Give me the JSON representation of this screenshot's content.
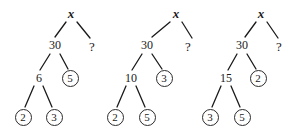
{
  "figure": {
    "background_color": "#ffffff",
    "ink_color": "#1a1a1a",
    "circle_stroke_color": "#2b2b2b",
    "root_label": "x",
    "unknown_label": "?"
  },
  "trees": [
    {
      "id": "tree-1",
      "root": {
        "label": "x",
        "kind": "variable",
        "x": 71,
        "y": 13
      },
      "nodes": [
        {
          "name": "root-x",
          "label": "x",
          "kind": "variable",
          "x": 71,
          "y": 13
        },
        {
          "name": "node-30",
          "label": "30",
          "kind": "plain",
          "x": 55,
          "y": 45
        },
        {
          "name": "node-unknown",
          "label": "?",
          "kind": "unknown",
          "x": 92,
          "y": 46
        },
        {
          "name": "node-6",
          "label": "6",
          "kind": "plain",
          "x": 39,
          "y": 78
        },
        {
          "name": "node-5",
          "label": "5",
          "kind": "circled",
          "x": 70,
          "y": 78
        },
        {
          "name": "node-2",
          "label": "2",
          "kind": "circled",
          "x": 23,
          "y": 117
        },
        {
          "name": "node-3",
          "label": "3",
          "kind": "circled",
          "x": 54,
          "y": 117
        }
      ],
      "edges": [
        {
          "from": "root-x",
          "to": "node-30",
          "x1": 66,
          "y1": 22,
          "x2": 55,
          "y2": 37
        },
        {
          "from": "root-x",
          "to": "node-unknown",
          "x1": 77,
          "y1": 22,
          "x2": 90,
          "y2": 38
        },
        {
          "from": "node-30",
          "to": "node-6",
          "x1": 50,
          "y1": 54,
          "x2": 40,
          "y2": 70
        },
        {
          "from": "node-30",
          "to": "node-5",
          "x1": 60,
          "y1": 54,
          "x2": 68,
          "y2": 69
        },
        {
          "from": "node-6",
          "to": "node-2",
          "x1": 34,
          "y1": 86,
          "x2": 25,
          "y2": 107
        },
        {
          "from": "node-6",
          "to": "node-3",
          "x1": 43,
          "y1": 86,
          "x2": 52,
          "y2": 107
        }
      ]
    },
    {
      "id": "tree-2",
      "root": {
        "label": "x",
        "kind": "variable",
        "x": 76,
        "y": 13
      },
      "nodes": [
        {
          "name": "root-x",
          "label": "x",
          "kind": "variable",
          "x": 76,
          "y": 13
        },
        {
          "name": "node-30",
          "label": "30",
          "kind": "plain",
          "x": 47,
          "y": 45
        },
        {
          "name": "node-unknown",
          "label": "?",
          "kind": "unknown",
          "x": 88,
          "y": 46
        },
        {
          "name": "node-10",
          "label": "10",
          "kind": "plain",
          "x": 31,
          "y": 78
        },
        {
          "name": "node-3",
          "label": "3",
          "kind": "circled",
          "x": 64,
          "y": 78
        },
        {
          "name": "node-2",
          "label": "2",
          "kind": "circled",
          "x": 15,
          "y": 117
        },
        {
          "name": "node-5",
          "label": "5",
          "kind": "circled",
          "x": 47,
          "y": 117
        }
      ],
      "edges": [
        {
          "from": "root-x",
          "to": "node-30",
          "x1": 70,
          "y1": 22,
          "x2": 52,
          "y2": 37
        },
        {
          "from": "root-x",
          "to": "node-unknown",
          "x1": 82,
          "y1": 22,
          "x2": 92,
          "y2": 38
        },
        {
          "from": "node-30",
          "to": "node-10",
          "x1": 42,
          "y1": 54,
          "x2": 32,
          "y2": 70
        },
        {
          "from": "node-30",
          "to": "node-3",
          "x1": 52,
          "y1": 54,
          "x2": 62,
          "y2": 69
        },
        {
          "from": "node-10",
          "to": "node-2",
          "x1": 26,
          "y1": 86,
          "x2": 17,
          "y2": 107
        },
        {
          "from": "node-10",
          "to": "node-5",
          "x1": 36,
          "y1": 86,
          "x2": 45,
          "y2": 107
        }
      ]
    },
    {
      "id": "tree-3",
      "root": {
        "label": "x",
        "kind": "variable",
        "x": 61,
        "y": 13
      },
      "nodes": [
        {
          "name": "root-x",
          "label": "x",
          "kind": "variable",
          "x": 61,
          "y": 13
        },
        {
          "name": "node-30",
          "label": "30",
          "kind": "plain",
          "x": 42,
          "y": 45
        },
        {
          "name": "node-unknown",
          "label": "?",
          "kind": "unknown",
          "x": 79,
          "y": 46
        },
        {
          "name": "node-15",
          "label": "15",
          "kind": "plain",
          "x": 26,
          "y": 78
        },
        {
          "name": "node-2",
          "label": "2",
          "kind": "circled",
          "x": 58,
          "y": 78
        },
        {
          "name": "node-3",
          "label": "3",
          "kind": "circled",
          "x": 10,
          "y": 117
        },
        {
          "name": "node-5",
          "label": "5",
          "kind": "circled",
          "x": 42,
          "y": 117
        }
      ],
      "edges": [
        {
          "from": "root-x",
          "to": "node-30",
          "x1": 56,
          "y1": 22,
          "x2": 45,
          "y2": 37
        },
        {
          "from": "root-x",
          "to": "node-unknown",
          "x1": 67,
          "y1": 22,
          "x2": 78,
          "y2": 38
        },
        {
          "from": "node-30",
          "to": "node-15",
          "x1": 37,
          "y1": 54,
          "x2": 28,
          "y2": 70
        },
        {
          "from": "node-30",
          "to": "node-2",
          "x1": 47,
          "y1": 54,
          "x2": 56,
          "y2": 69
        },
        {
          "from": "node-15",
          "to": "node-3",
          "x1": 21,
          "y1": 86,
          "x2": 12,
          "y2": 107
        },
        {
          "from": "node-15",
          "to": "node-5",
          "x1": 31,
          "y1": 86,
          "x2": 40,
          "y2": 107
        }
      ]
    }
  ],
  "tree_offsets": [
    0,
    100,
    200
  ]
}
